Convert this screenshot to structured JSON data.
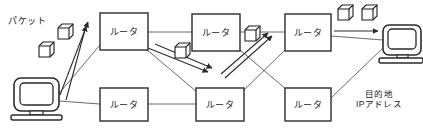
{
  "diagram": {
    "title_label": "パケット",
    "destination_label_line1": "目的地",
    "destination_label_line2": "IPアドレス",
    "router_label": "ルータ",
    "stroke_color": "#2b2b2b",
    "line_color": "#555555",
    "fill_color": "#ffffff",
    "nodes": {
      "source_computer": {
        "name": "source-computer",
        "x": 14,
        "y": 78,
        "w": 45,
        "h": 42
      },
      "destination_computer": {
        "name": "destination-computer",
        "x": 381,
        "y": 25,
        "w": 40,
        "h": 36
      },
      "routers": [
        {
          "id": "router-top-1",
          "label": "ルータ",
          "x": 100,
          "y": 13,
          "w": 48,
          "h": 37
        },
        {
          "id": "router-top-2",
          "label": "ルータ",
          "x": 192,
          "y": 14,
          "w": 48,
          "h": 37
        },
        {
          "id": "router-top-3",
          "label": "ルータ",
          "x": 285,
          "y": 14,
          "w": 46,
          "h": 37
        },
        {
          "id": "router-bottom-1",
          "label": "ルータ",
          "x": 100,
          "y": 88,
          "w": 48,
          "h": 33
        },
        {
          "id": "router-bottom-2",
          "label": "ルータ",
          "x": 196,
          "y": 88,
          "w": 48,
          "h": 33
        },
        {
          "id": "router-bottom-3",
          "label": "ルータ",
          "x": 285,
          "y": 88,
          "w": 46,
          "h": 33
        }
      ],
      "packets": [
        {
          "id": "packet-1",
          "x": 58,
          "y": 24,
          "s": 15
        },
        {
          "id": "packet-2",
          "x": 39,
          "y": 42,
          "s": 15
        },
        {
          "id": "packet-3",
          "x": 175,
          "y": 43,
          "s": 15
        },
        {
          "id": "packet-4",
          "x": 245,
          "y": 26,
          "s": 15
        },
        {
          "id": "packet-5",
          "x": 338,
          "y": 5,
          "s": 15
        },
        {
          "id": "packet-6",
          "x": 362,
          "y": 5,
          "s": 15
        }
      ]
    }
  }
}
